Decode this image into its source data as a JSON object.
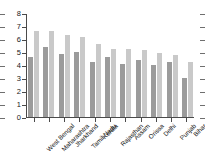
{
  "chart_data": {
    "type": "bar",
    "title": "",
    "subtitle": "",
    "xlabel": "",
    "ylabel": "",
    "ylim": [
      0,
      8
    ],
    "yticks": [
      0,
      1,
      2,
      3,
      4,
      5,
      6,
      7,
      8
    ],
    "grid": false,
    "legend": "none",
    "orientation": "vertical",
    "grouping": "grouped",
    "categories": [
      "West Bengal",
      "Maharashtra",
      "Jharkhand",
      "Tamil Nadu",
      "Kerala",
      "Rajasthan",
      "Assam",
      "Orissa",
      "Delhi",
      "Punjab",
      "Bihar"
    ],
    "series": [
      {
        "name": "series-1",
        "color": "#9b9b9b",
        "values": [
          4.6,
          5.4,
          4.85,
          5.0,
          4.2,
          4.65,
          4.1,
          4.4,
          4.0,
          4.2,
          3.0
        ]
      },
      {
        "name": "series-2",
        "color": "#c9c9c9",
        "values": [
          6.6,
          6.6,
          6.3,
          6.15,
          5.6,
          5.2,
          5.25,
          5.15,
          4.9,
          4.75,
          4.2
        ]
      }
    ]
  },
  "axis": {
    "y_tick_labels": [
      "8",
      "7",
      "6",
      "5",
      "4",
      "3",
      "2",
      "1",
      "0"
    ]
  }
}
